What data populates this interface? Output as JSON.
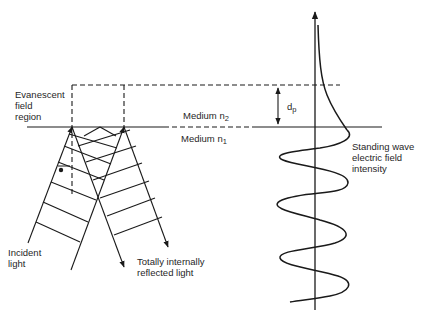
{
  "diagram": {
    "labels": {
      "evanescent_line1": "Evanescent",
      "evanescent_line2": "field",
      "evanescent_line3": "region",
      "medium_upper": "Medium n",
      "medium_upper_sub": "2",
      "medium_lower": "Medium n",
      "medium_lower_sub": "1",
      "penetration_depth": "d",
      "penetration_depth_sub": "p",
      "standing_wave_line1": "Standing wave",
      "standing_wave_line2": "electric field",
      "standing_wave_line3": "intensity",
      "incident_line1": "Incident",
      "incident_line2": "light",
      "reflected_line1": "Totally internally",
      "reflected_line2": "reflected light"
    },
    "colors": {
      "ink": "#1a1a1a",
      "background": "#ffffff"
    }
  }
}
